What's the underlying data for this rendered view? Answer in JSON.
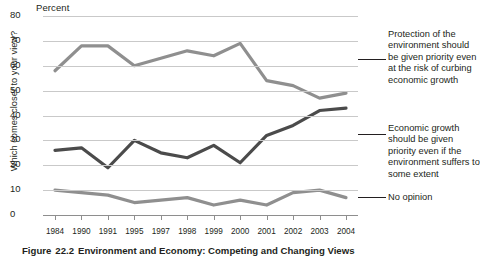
{
  "figure": {
    "percent_label": "Percent",
    "y_axis_title": "Which comes closer to your view?",
    "caption_prefix": "Figure",
    "caption_number": "22.2",
    "caption_text": "Environment and Economy: Competing and Changing Views"
  },
  "legend": {
    "environment": "Protection of the environment should be given priority even at the risk of curbing economic growth",
    "economy": "Economic growth should be given priority even if the environment suffers to some extent",
    "no_opinion": "No opinion"
  },
  "colors": {
    "environment_line": "#8f8f8f",
    "economy_line": "#4b4b4b",
    "no_opinion_line": "#8f8f8f",
    "gridline": "#c9c9c9",
    "axis": "#8e8e8e",
    "text": "#231f20"
  },
  "chart_data": {
    "type": "line",
    "title": "Environment and Economy: Competing and Changing Views",
    "xlabel": "",
    "ylabel": "Percent",
    "ylim": [
      0,
      80
    ],
    "yticks": [
      0,
      10,
      20,
      30,
      40,
      50,
      60,
      70,
      80
    ],
    "grid": true,
    "legend_position": "right",
    "categories": [
      "1984",
      "1990",
      "1991",
      "1995",
      "1997",
      "1998",
      "1999",
      "2000",
      "2001",
      "2002",
      "2003",
      "2004"
    ],
    "series": [
      {
        "name": "Protection of the environment should be given priority even at the risk of curbing economic growth",
        "color": "#8f8f8f",
        "values": [
          58,
          68,
          68,
          60,
          63,
          66,
          64,
          69,
          54,
          52,
          47,
          49
        ]
      },
      {
        "name": "Economic growth should be given priority even if the environment suffers to some extent",
        "color": "#4b4b4b",
        "values": [
          26,
          27,
          19,
          30,
          25,
          23,
          28,
          21,
          32,
          36,
          42,
          43
        ]
      },
      {
        "name": "No opinion",
        "color": "#8f8f8f",
        "values": [
          10,
          9,
          8,
          5,
          6,
          7,
          4,
          6,
          4,
          9,
          10,
          7
        ]
      }
    ]
  }
}
